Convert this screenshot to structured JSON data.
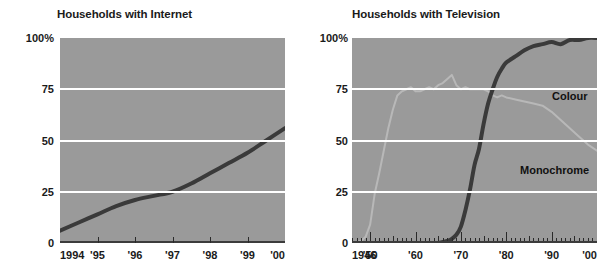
{
  "charts": [
    {
      "id": "internet",
      "title": "Households with Internet",
      "y_ticks": [
        {
          "label": "100%",
          "value": 100
        },
        {
          "label": "75",
          "value": 75
        },
        {
          "label": "50",
          "value": 50
        },
        {
          "label": "25",
          "value": 25
        },
        {
          "label": "0",
          "value": 0
        }
      ],
      "x_ticks": [
        {
          "label": "1994",
          "value": 1994
        },
        {
          "label": "'95",
          "value": 1995
        },
        {
          "label": "'96",
          "value": 1996
        },
        {
          "label": "'97",
          "value": 1997
        },
        {
          "label": "'98",
          "value": 1998
        },
        {
          "label": "'99",
          "value": 1999
        },
        {
          "label": "'00",
          "value": 2000
        }
      ]
    },
    {
      "id": "television",
      "title": "Households with Television",
      "y_ticks": [
        {
          "label": "100%",
          "value": 100
        },
        {
          "label": "75",
          "value": 75
        },
        {
          "label": "50",
          "value": 50
        },
        {
          "label": "25",
          "value": 25
        },
        {
          "label": "0",
          "value": 0
        }
      ],
      "x_ticks": [
        {
          "label": "1946",
          "value": 1946
        },
        {
          "label": "'50",
          "value": 1950
        },
        {
          "label": "'60",
          "value": 1960
        },
        {
          "label": "'70",
          "value": 1970
        },
        {
          "label": "'80",
          "value": 1980
        },
        {
          "label": "'90",
          "value": 1990
        },
        {
          "label": "'00",
          "value": 2000
        }
      ],
      "series_labels": {
        "colour": "Colour",
        "monochrome": "Monochrome"
      }
    }
  ],
  "colors": {
    "plot_background": "#9a9a9a",
    "gridline": "#ffffff",
    "axis": "#3c3c3c",
    "series_colour": "#3a3a3a",
    "series_monochrome": "#b8b8b8",
    "internet_line": "#3a3a3a",
    "text": "#1a1a1a"
  },
  "chart_data": [
    {
      "type": "line",
      "title": "Households with Internet",
      "xlabel": "",
      "ylabel": "",
      "xlim": [
        1994,
        2000
      ],
      "ylim": [
        0,
        100
      ],
      "grid": true,
      "gridlines_y": [
        25,
        50,
        75
      ],
      "x_tick_labels": [
        "1994",
        "'95",
        "'96",
        "'97",
        "'98",
        "'99",
        "'00"
      ],
      "y_tick_labels": [
        "0",
        "25",
        "50",
        "75",
        "100%"
      ],
      "legend": "none",
      "x": [
        1994,
        1994.5,
        1995,
        1995.5,
        1996,
        1996.5,
        1997,
        1997.5,
        1998,
        1998.5,
        1999,
        1999.5,
        2000
      ],
      "series": [
        {
          "name": "Households with Internet",
          "values": [
            6,
            10,
            14,
            18,
            21,
            23,
            25,
            29,
            34,
            39,
            44,
            50,
            56
          ]
        }
      ]
    },
    {
      "type": "line",
      "title": "Households with Television",
      "xlabel": "",
      "ylabel": "",
      "xlim": [
        1946,
        2000
      ],
      "ylim": [
        0,
        100
      ],
      "grid": true,
      "gridlines_y": [
        25,
        50,
        75
      ],
      "x_tick_labels": [
        "1946",
        "'50",
        "'60",
        "'70",
        "'80",
        "'90",
        "'00"
      ],
      "y_tick_labels": [
        "0",
        "25",
        "50",
        "75",
        "100%"
      ],
      "minor_ticks": "every year; taller tick every 5 years",
      "legend": "inline labels on curves",
      "series": [
        {
          "name": "Monochrome",
          "x": [
            1946,
            1947,
            1948,
            1949,
            1950,
            1951,
            1952,
            1953,
            1954,
            1955,
            1956,
            1957,
            1958,
            1959,
            1960,
            1961,
            1962,
            1963,
            1964,
            1965,
            1966,
            1967,
            1968,
            1969,
            1970,
            1971,
            1972,
            1973,
            1974,
            1975,
            1976,
            1977,
            1978,
            1979,
            1980,
            1982,
            1984,
            1986,
            1988,
            1990,
            1992,
            1994,
            1996,
            1998,
            2000
          ],
          "values": [
            0,
            0.5,
            1,
            3,
            9,
            24,
            34,
            45,
            56,
            65,
            72,
            74,
            75,
            76,
            74,
            74,
            75,
            76,
            75,
            77,
            78,
            80,
            82,
            77,
            75,
            76,
            75,
            75,
            75,
            75,
            74,
            72,
            71,
            72,
            71,
            70,
            69,
            68,
            67,
            64,
            60,
            56,
            52,
            48,
            45
          ]
        },
        {
          "name": "Colour",
          "x": [
            1965,
            1966,
            1967,
            1968,
            1969,
            1970,
            1971,
            1972,
            1973,
            1974,
            1975,
            1976,
            1977,
            1978,
            1979,
            1980,
            1982,
            1984,
            1986,
            1988,
            1990,
            1992,
            1994,
            1996,
            1998,
            2000
          ],
          "values": [
            0,
            0.5,
            1,
            2,
            4,
            8,
            16,
            26,
            38,
            46,
            58,
            68,
            75,
            81,
            85,
            88,
            91,
            94,
            96,
            97,
            98,
            97,
            99,
            99,
            100,
            100
          ]
        }
      ]
    }
  ]
}
